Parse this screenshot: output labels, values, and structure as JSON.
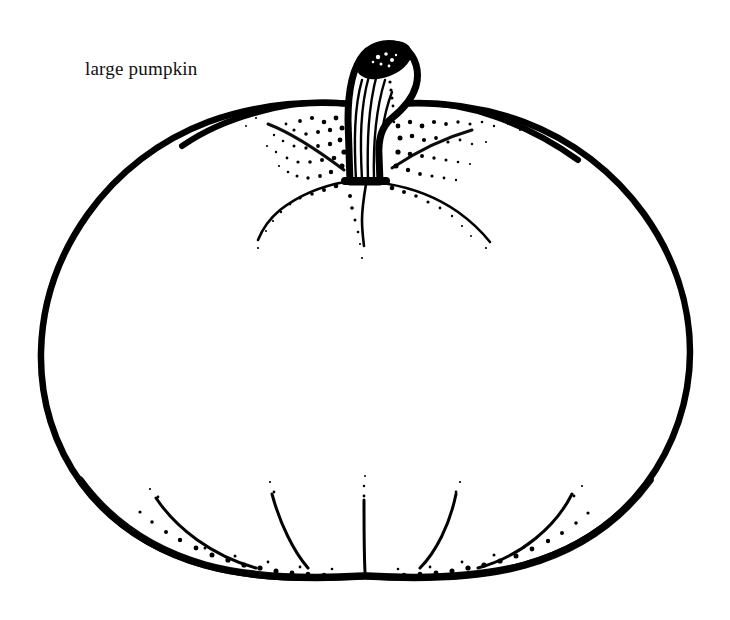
{
  "page": {
    "width": 730,
    "height": 620,
    "background_color": "#ffffff",
    "ink_color": "#000000",
    "title": "large pumpkin"
  },
  "label": {
    "text": "large pumpkin",
    "x": 85,
    "y": 58,
    "font_size_px": 19,
    "color": "#111111"
  },
  "illustration": {
    "subject": "pumpkin",
    "style": "black-and-white pen-and-ink line drawing with stipple shading",
    "name": "large-pumpkin-illustration",
    "body": {
      "description": "large rounded pumpkin body, widest near vertical middle, flattened base",
      "left_extent_px": 40,
      "right_extent_px": 692,
      "top_extent_px": 98,
      "bottom_extent_px": 578,
      "outline_width_px": 6
    },
    "stem": {
      "description": "thick curved cut stem leaning right with vertical ribbing lines and dark elliptical cut top",
      "top_y_px": 44,
      "base_y_px": 182,
      "center_x_px": 370,
      "rib_line_count": 6,
      "cut_top_fill": "#000000"
    },
    "ribs_top": {
      "description": "curved rib lines radiating from stem base, fading into stipple dots",
      "count": 5
    },
    "ribs_bottom": {
      "description": "curved rib lines rising from the base, converging at the bottom edge",
      "count": 5
    },
    "stipple": {
      "description": "dense dot shading clustered around the stem base and along the bottom edge",
      "dot_color": "#000000"
    }
  }
}
